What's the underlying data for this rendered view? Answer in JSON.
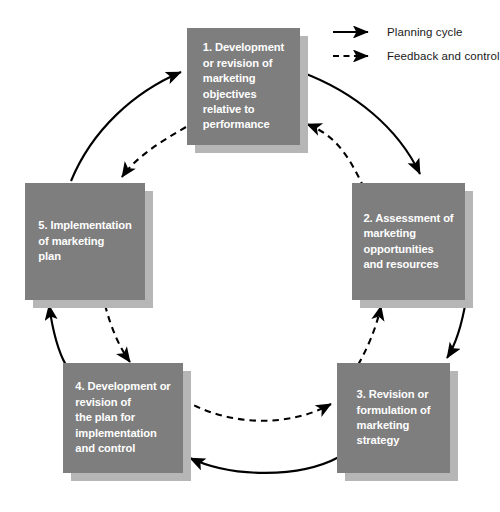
{
  "diagram": {
    "colors": {
      "box_fill": "#7e7e7e",
      "box_shadow": "#b6b6b6",
      "box_text": "#ffffff",
      "arrow": "#000000",
      "background": "#ffffff"
    },
    "nodes": [
      {
        "id": 1,
        "number": "1.",
        "text": "1. Development\nor revision of\nmarketing\nobjectives\nrelative to\nperformance"
      },
      {
        "id": 2,
        "number": "2.",
        "text": "2. Assessment of\nmarketing\nopportunities\nand resources"
      },
      {
        "id": 3,
        "number": "3.",
        "text": "3. Revision or\nformulation of\nmarketing\nstrategy"
      },
      {
        "id": 4,
        "number": "4.",
        "text": "4. Development or\nrevision of\nthe plan for\nimplementation\nand control"
      },
      {
        "id": 5,
        "number": "5.",
        "text": "5. Implementation\nof marketing\nplan"
      }
    ],
    "legend": {
      "items": [
        {
          "style": "solid",
          "label": "Planning cycle"
        },
        {
          "style": "dashed",
          "label": "Feedback and control"
        }
      ]
    },
    "connections": {
      "planning_cycle": [
        {
          "from": 1,
          "to": 2
        },
        {
          "from": 2,
          "to": 3
        },
        {
          "from": 3,
          "to": 4
        },
        {
          "from": 4,
          "to": 5
        },
        {
          "from": 5,
          "to": 1
        }
      ],
      "feedback_and_control": [
        {
          "from": 2,
          "to": 1
        },
        {
          "from": 3,
          "to": 2
        },
        {
          "from": 4,
          "to": 3
        },
        {
          "from": 5,
          "to": 4
        }
      ]
    }
  }
}
